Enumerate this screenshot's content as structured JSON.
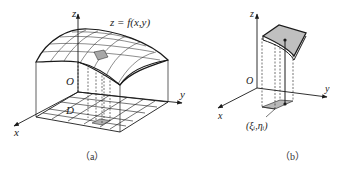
{
  "figure_a": {
    "caption": "（a）",
    "axis_z": "z",
    "axis_x": "x",
    "axis_y": "y",
    "origin": "O",
    "surface_label": "z = f(x,y)",
    "region_label": "D"
  },
  "figure_b": {
    "caption": "（b）",
    "axis_z": "z",
    "axis_x": "x",
    "axis_y": "y",
    "origin": "O",
    "point_label": "(ξᵢ,ηᵢ)"
  },
  "colors": {
    "line": "#1a1a1a",
    "shade": "#b8b8b8",
    "background": "#ffffff"
  }
}
